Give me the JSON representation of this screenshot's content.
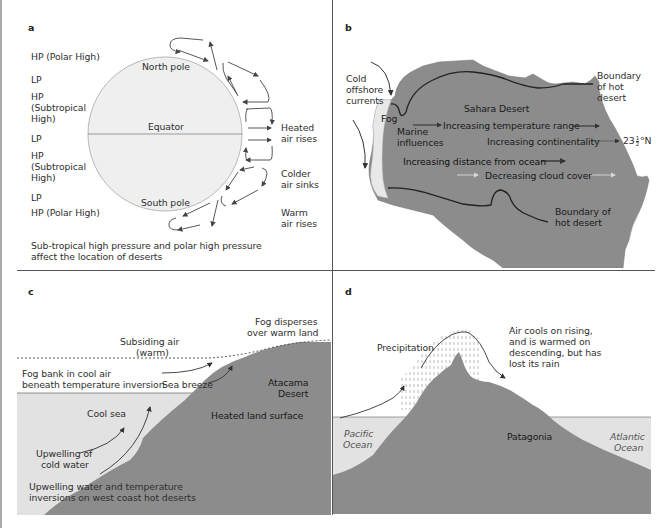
{
  "figure": {
    "panels": [
      {
        "id": "a",
        "letter": "a",
        "left_labels": [
          "HP (Polar High)",
          "LP",
          "HP",
          "(Subtropical",
          "High)",
          "LP",
          "HP",
          "(Subtropical",
          "High)",
          "LP",
          "HP (Polar High)"
        ],
        "globe_labels": {
          "north": "North pole",
          "equator": "Equator",
          "south": "South pole"
        },
        "right_labels": {
          "heated_1": "Heated",
          "heated_2": "air rises",
          "colder_1": "Colder",
          "colder_2": "air sinks",
          "warm_1": "Warm",
          "warm_2": "air rises"
        },
        "caption_1": "Sub-tropical high pressure and polar high pressure",
        "caption_2": "affect the location of deserts"
      },
      {
        "id": "b",
        "letter": "b",
        "labels": {
          "cold_1": "Cold",
          "cold_2": "offshore",
          "cold_3": "currents",
          "boundary_top_1": "Boundary",
          "boundary_top_2": "of hot",
          "boundary_top_3": "desert",
          "sahara": "Sahara Desert",
          "fog": "Fog",
          "marine_1": "Marine",
          "marine_2": "influences",
          "temp_range": "Increasing temperature range",
          "continentality": "Increasing continentality",
          "latitude_whole": "23",
          "latitude_num": "1",
          "latitude_den": "2",
          "latitude_suffix": "°N",
          "distance": "Increasing distance from ocean",
          "cloud": "Decreasing cloud cover",
          "boundary_bottom_1": "Boundary of",
          "boundary_bottom_2": "hot desert"
        }
      },
      {
        "id": "c",
        "letter": "c",
        "labels": {
          "fog_disperses_1": "Fog disperses",
          "fog_disperses_2": "over warm land",
          "subsiding_1": "Subsiding air",
          "subsiding_2": "(warm)",
          "fog_bank_1": "Fog bank in cool air",
          "fog_bank_2": "beneath temperature inversion",
          "sea_breeze": "Sea breeze",
          "atacama_1": "Atacama",
          "atacama_2": "Desert",
          "cool_sea": "Cool sea",
          "heated_land": "Heated land surface",
          "upwelling_1": "Upwelling of",
          "upwelling_2": "cold water",
          "caption_1": "Upwelling water and temperature",
          "caption_2": "inversions on west coast hot deserts"
        }
      },
      {
        "id": "d",
        "letter": "d",
        "labels": {
          "precipitation": "Precipitation",
          "air_cools_1": "Air cools on rising,",
          "air_cools_2": "and is warmed on",
          "air_cools_3": "descending, but has",
          "air_cools_4": "lost its rain",
          "pacific_1": "Pacific",
          "pacific_2": "Ocean",
          "patagonia": "Patagonia",
          "atlantic_1": "Atlantic",
          "atlantic_2": "Ocean"
        }
      }
    ],
    "colors": {
      "land": "#8c8c8c",
      "sea": "#e4e4e4",
      "fog": "#e8e8e8",
      "globe_fill": "#efefef",
      "divider": "#555555"
    }
  }
}
